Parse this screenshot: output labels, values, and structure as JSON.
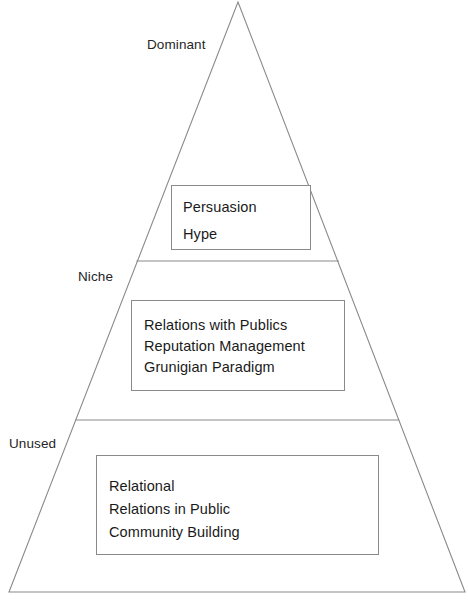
{
  "diagram": {
    "type": "pyramid",
    "shape": {
      "outline_color": "#8a8a8a",
      "divider_color": "#8a8a8a",
      "fill_color": "#ffffff",
      "apex": [
        238,
        2
      ],
      "base_left": [
        9,
        592
      ],
      "base_right": [
        465,
        592
      ],
      "divider_y_values": [
        261,
        420
      ]
    },
    "tiers": [
      {
        "id": "dominant",
        "label": "Dominant",
        "box": {
          "items": [
            "Persuasion",
            "Hype"
          ]
        }
      },
      {
        "id": "niche",
        "label": "Niche",
        "box": {
          "items": [
            "Relations with Publics",
            "Reputation Management",
            "Grunigian Paradigm"
          ]
        }
      },
      {
        "id": "unused",
        "label": "Unused",
        "box": {
          "items": [
            "Relational",
            "Relations in Public",
            "Community Building"
          ]
        }
      }
    ]
  }
}
